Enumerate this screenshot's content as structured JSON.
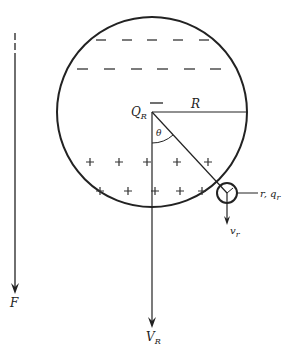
{
  "diagram": {
    "type": "physics-free-body",
    "colors": {
      "ink": "#222222",
      "background": "#ffffff"
    },
    "labels": {
      "large_charge": "Q",
      "large_charge_sub": "R",
      "radius": "R",
      "angle": "θ",
      "small_radius_charge": "r, q",
      "small_radius_charge_sub": "r",
      "small_velocity": "v",
      "small_velocity_sub": "r",
      "field": "F",
      "large_velocity": "V",
      "large_velocity_sub": "R"
    },
    "charge_rows": {
      "negative": {
        "symbol": "−",
        "rows": 2
      },
      "positive": {
        "symbol": "+",
        "rows": 2
      }
    }
  }
}
